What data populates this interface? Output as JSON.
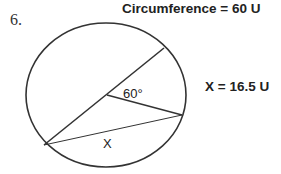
{
  "problem": {
    "number": "6.",
    "circumference_label": "Circumference = 60 U",
    "answer_label": "X = 16.5 U"
  },
  "diagram": {
    "angle_label": "60°",
    "chord_label": "X",
    "central_angle_degrees": 60,
    "circumference": 60,
    "circumference_unit": "U",
    "x_value": 16.5,
    "x_unit": "U",
    "colors": {
      "stroke": "#333333",
      "text": "#222222",
      "background": "#ffffff"
    }
  }
}
